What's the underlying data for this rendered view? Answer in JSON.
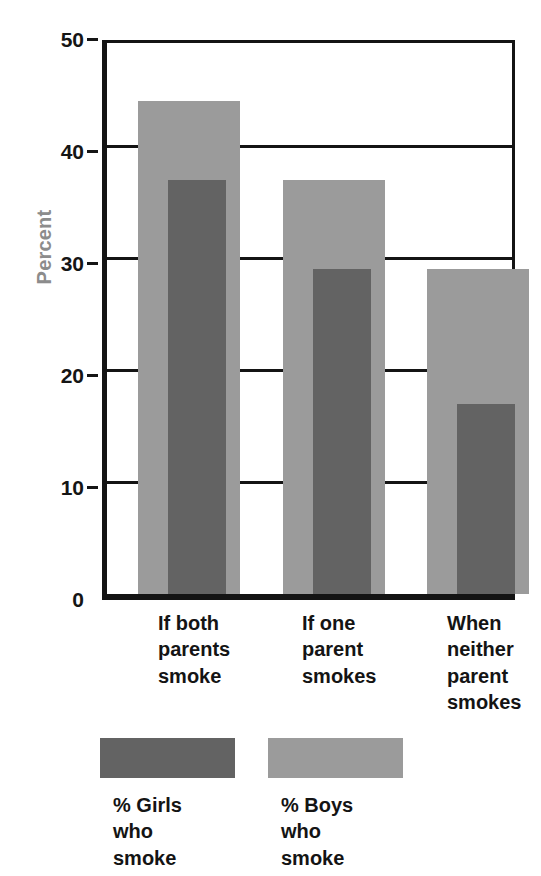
{
  "chart_data": {
    "type": "bar",
    "title": "",
    "xlabel": "",
    "ylabel": "Percent",
    "ylim": [
      0,
      50
    ],
    "yticks": [
      0,
      10,
      20,
      30,
      40,
      50
    ],
    "grid": true,
    "legend_position": "bottom",
    "categories": [
      "If both\nparents\nsmoke",
      "If one\nparent\nsmokes",
      "When\nneither\nparent\nsmokes"
    ],
    "series": [
      {
        "name": "% Boys\nwho\nsmoke",
        "short_name": "% Boys who smoke",
        "color": "#9b9b9b",
        "values": [
          44,
          37,
          29
        ]
      },
      {
        "name": "% Girls\nwho\nsmoke",
        "short_name": "% Girls who smoke",
        "color": "#636363",
        "values": [
          37,
          29,
          17
        ]
      }
    ]
  },
  "axis": {
    "y_title": "Percent",
    "y_title_color": "#8c8c8c",
    "tick_labels": [
      "50",
      "40",
      "30",
      "20",
      "10",
      "0"
    ]
  },
  "legend": {
    "entries": [
      {
        "label": "% Girls\nwho\nsmoke",
        "color": "#636363"
      },
      {
        "label": "% Boys\nwho\nsmoke",
        "color": "#9b9b9b"
      }
    ]
  },
  "colors": {
    "boys": "#9b9b9b",
    "girls": "#636363",
    "axis": "#141414",
    "background": "#ffffff"
  }
}
